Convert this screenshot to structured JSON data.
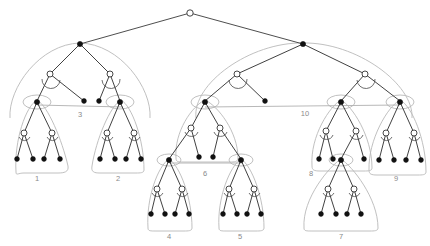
{
  "figure": {
    "background_color": "#ffffff",
    "width": 430,
    "height": 246,
    "colors": {
      "edge": "#2b2b2b",
      "blob_outline": "#b9b9b9",
      "connector": "#b0b0b0",
      "node_filled": "#111111",
      "node_hollow_fill": "#ffffff",
      "label": "#8a8a8a"
    }
  },
  "cluster_labels": [
    {
      "id": "cluster-label-1",
      "text": "1",
      "x": 37,
      "y": 179
    },
    {
      "id": "cluster-label-2",
      "text": "2",
      "x": 118,
      "y": 179
    },
    {
      "id": "cluster-label-3",
      "text": "3",
      "x": 80,
      "y": 115
    },
    {
      "id": "cluster-label-4",
      "text": "4",
      "x": 169,
      "y": 237
    },
    {
      "id": "cluster-label-5",
      "text": "5",
      "x": 240,
      "y": 237
    },
    {
      "id": "cluster-label-6",
      "text": "6",
      "x": 205,
      "y": 174
    },
    {
      "id": "cluster-label-7",
      "text": "7",
      "x": 341,
      "y": 237
    },
    {
      "id": "cluster-label-8",
      "text": "8",
      "x": 311,
      "y": 174
    },
    {
      "id": "cluster-label-9",
      "text": "9",
      "x": 396,
      "y": 179
    },
    {
      "id": "cluster-label-10",
      "text": "10",
      "x": 305,
      "y": 114
    }
  ],
  "nodes": {
    "root": {
      "x": 190,
      "y": 13,
      "type": "hollow"
    },
    "left_main": {
      "x": 80,
      "y": 44,
      "type": "filled"
    },
    "right_main": {
      "x": 303,
      "y": 44,
      "type": "filled"
    },
    "l_inner_a": {
      "x": 50,
      "y": 74,
      "type": "hollow"
    },
    "l_inner_b": {
      "x": 110,
      "y": 74,
      "type": "hollow"
    },
    "r_inner_a": {
      "x": 237,
      "y": 74,
      "type": "hollow"
    },
    "r_inner_b": {
      "x": 365,
      "y": 74,
      "type": "hollow"
    },
    "c1_top": {
      "x": 37,
      "y": 102,
      "type": "filled"
    },
    "c2_top": {
      "x": 120,
      "y": 102,
      "type": "filled"
    },
    "c6_top": {
      "x": 205,
      "y": 102,
      "type": "filled"
    },
    "c8_top": {
      "x": 341,
      "y": 102,
      "type": "filled"
    },
    "c9_top": {
      "x": 400,
      "y": 102,
      "type": "filled"
    },
    "l_leaf_1": {
      "x": 84,
      "y": 101,
      "type": "filled"
    },
    "l_leaf_2": {
      "x": 99,
      "y": 101,
      "type": "filled"
    },
    "r_leaf_1": {
      "x": 265,
      "y": 101,
      "type": "filled"
    },
    "c4_top": {
      "x": 169,
      "y": 160,
      "type": "filled"
    },
    "c5_top": {
      "x": 241,
      "y": 160,
      "type": "filled"
    },
    "c7_top": {
      "x": 341,
      "y": 160,
      "type": "filled"
    }
  },
  "connectors": [
    {
      "id": "connector-3",
      "x1": 37,
      "y1": 105,
      "x2": 123,
      "y2": 107,
      "label": "3"
    },
    {
      "id": "connector-6",
      "x1": 169,
      "y1": 163,
      "x2": 243,
      "y2": 163,
      "label": "6"
    },
    {
      "id": "connector-10",
      "x1": 205,
      "y1": 107,
      "x2": 400,
      "y2": 105,
      "label": "10"
    }
  ],
  "structure_note": "Binary recursive tree: root splits into two filled main nodes; each descends through hollow internal nodes with small arcs into labelled leaf clusters 1-10."
}
